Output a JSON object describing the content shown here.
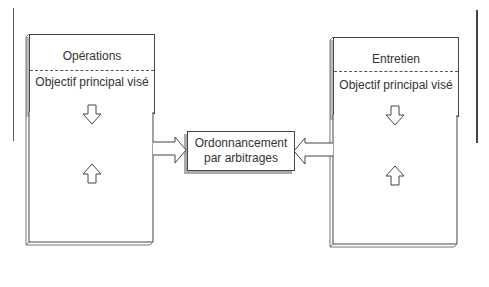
{
  "left_panel": {
    "title": "Opérations",
    "objective": "Objectif principal visé",
    "box_line1": "Ordonnancement",
    "box_line2": "optimal",
    "input_line1": "Fabrication –",
    "input_line2": "opérations requises"
  },
  "center_box": {
    "line1": "Ordonnancement",
    "line2": "par arbitrages"
  },
  "right_panel": {
    "title": "Entretien",
    "objective": "Objectif principal visé",
    "box_line1": "Ordonnancement",
    "box_line2": "optimal",
    "input_line1": "Entretien",
    "input_line2": "requis"
  }
}
